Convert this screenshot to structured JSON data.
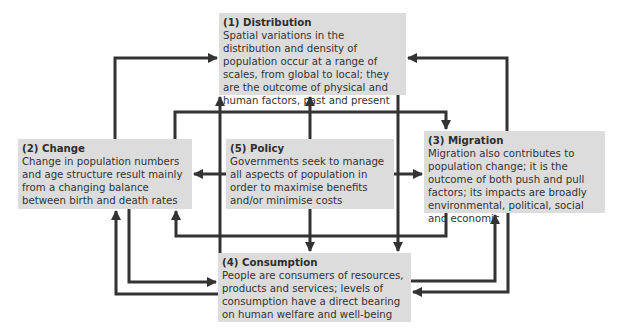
{
  "diagram": {
    "nodes": [
      {
        "id": "distribution",
        "title": "(1) Distribution",
        "text": "Spatial variations in the distribution and density of population occur at a range of scales, from global to local; they are the outcome of physical and human factors, past and present"
      },
      {
        "id": "change",
        "title": "(2) Change",
        "text": "Change in population numbers and age structure result mainly from a changing balance between birth and death rates"
      },
      {
        "id": "migration",
        "title": "(3) Migration",
        "text": "Migration also contributes to population change; it is the outcome of both push and pull factors; its impacts are broadly environmental, political, social and economic"
      },
      {
        "id": "consumption",
        "title": "(4) Consumption",
        "text": "People are consumers of resources, products and services; levels of consumption have a direct bearing on human welfare and well-being"
      },
      {
        "id": "policy",
        "title": "(5) Policy",
        "text": "Governments seek to manage all aspects of population in order to maximise benefits and/or minimise costs"
      }
    ],
    "edges": [
      {
        "from": "change",
        "to": "distribution"
      },
      {
        "from": "migration",
        "to": "distribution"
      },
      {
        "from": "consumption",
        "to": "distribution"
      },
      {
        "from": "policy",
        "to": "distribution"
      },
      {
        "from": "change",
        "to": "migration"
      },
      {
        "from": "distribution",
        "to": "consumption"
      },
      {
        "from": "policy",
        "to": "change"
      },
      {
        "from": "policy",
        "to": "migration"
      },
      {
        "from": "policy",
        "to": "consumption"
      },
      {
        "from": "migration",
        "to": "change"
      },
      {
        "from": "change",
        "to": "consumption"
      },
      {
        "from": "consumption",
        "to": "change"
      },
      {
        "from": "consumption",
        "to": "migration"
      },
      {
        "from": "migration",
        "to": "consumption"
      }
    ],
    "colors": {
      "box": "#dcdcdc",
      "arrow": "#333333",
      "text": "#333333"
    }
  }
}
